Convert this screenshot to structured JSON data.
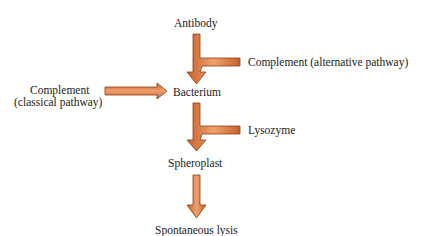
{
  "diagram": {
    "nodes": {
      "antibody": "Antibody",
      "alternative": "Complement (alternative pathway)",
      "classical_line1": "Complement",
      "classical_line2": "(classical pathway)",
      "bacterium": "Bacterium",
      "lysozyme": "Lysozyme",
      "spheroplast": "Spheroplast",
      "lysis": "Spontaneous lysis"
    },
    "edges": [
      {
        "from": "Antibody",
        "to": "Bacterium"
      },
      {
        "from": "Complement (alternative pathway)",
        "to": "Bacterium"
      },
      {
        "from": "Complement (classical pathway)",
        "to": "Bacterium"
      },
      {
        "from": "Bacterium",
        "to": "Spheroplast"
      },
      {
        "from": "Lysozyme",
        "to": "Spheroplast"
      },
      {
        "from": "Spheroplast",
        "to": "Spontaneous lysis"
      }
    ],
    "colors": {
      "arrow_fill": "#e07a3c",
      "arrow_stroke": "#8a3d18"
    }
  }
}
